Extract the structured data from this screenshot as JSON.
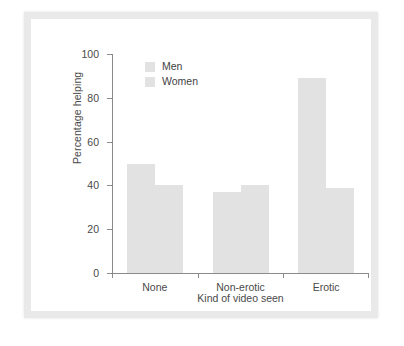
{
  "chart_data": {
    "type": "bar",
    "title": "",
    "categories": [
      "None",
      "Non-erotic",
      "Erotic"
    ],
    "series": [
      {
        "name": "Men",
        "values": [
          50,
          37,
          89
        ],
        "color": "#e2e2e2"
      },
      {
        "name": "Women",
        "values": [
          40,
          40,
          39
        ],
        "color": "#e2e2e2"
      }
    ],
    "xlabel": "Kind of video seen",
    "ylabel": "Percentage helping",
    "ylim": [
      0,
      100
    ],
    "yticks": [
      0,
      20,
      40,
      60,
      80,
      100
    ],
    "ytick_labels": [
      "0",
      "20",
      "40",
      "60",
      "80",
      "100"
    ],
    "grid": false,
    "legend_position": "top-left",
    "legend_entries": [
      "Men",
      "Women"
    ]
  },
  "figure": {
    "frame_color": "#e9e9e9",
    "background": "#ffffff",
    "axis_color": "#8b8b8b",
    "text_color": "#4a4a4a"
  }
}
